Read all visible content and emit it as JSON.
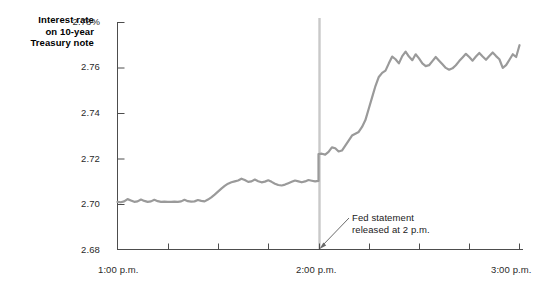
{
  "chart_data": {
    "type": "line",
    "title": "",
    "ylabel": "Interest rate on 10-year Treasury note",
    "xlabel": "",
    "ylim": [
      2.68,
      2.78
    ],
    "xlim": [
      "1:00 p.m.",
      "3:00 p.m."
    ],
    "grid": false,
    "legend": false,
    "y_unit": "%",
    "y_ticks": [
      "2.68",
      "2.70",
      "2.72",
      "2.74",
      "2.76",
      "2.78%"
    ],
    "y_tick_values": [
      2.68,
      2.7,
      2.72,
      2.74,
      2.76,
      2.78
    ],
    "x_ticks": [
      "1:00 p.m.",
      "2:00 p.m.",
      "3:00 p.m."
    ],
    "x_tick_values": [
      0,
      60,
      120
    ],
    "x_minor_tick_values": [
      15,
      30,
      45,
      75,
      90,
      105
    ],
    "series": [
      {
        "name": "10-year Treasury note yield",
        "color": "#9a9a9a",
        "x": [
          0,
          1,
          2,
          3,
          4,
          5,
          6,
          7,
          8,
          9,
          10,
          11,
          12,
          13,
          14,
          15,
          16,
          17,
          18,
          19,
          20,
          21,
          22,
          23,
          24,
          25,
          26,
          27,
          28,
          29,
          30,
          31,
          32,
          33,
          34,
          35,
          36,
          37,
          38,
          39,
          40,
          41,
          42,
          43,
          44,
          45,
          46,
          47,
          48,
          49,
          50,
          51,
          52,
          53,
          54,
          55,
          56,
          57,
          58,
          59,
          60,
          60,
          61,
          62,
          63,
          64,
          65,
          66,
          67,
          68,
          69,
          70,
          71,
          72,
          73,
          74,
          75,
          76,
          77,
          78,
          79,
          80,
          81,
          82,
          83,
          84,
          85,
          86,
          87,
          88,
          89,
          90,
          91,
          92,
          93,
          94,
          95,
          96,
          97,
          98,
          99,
          100,
          101,
          102,
          103,
          104,
          105,
          106,
          107,
          108,
          109,
          110,
          111,
          112,
          113,
          114,
          115,
          116,
          117,
          118,
          119,
          120
        ],
        "y": [
          2.701,
          2.7008,
          2.7012,
          2.7022,
          2.7016,
          2.701,
          2.7012,
          2.702,
          2.7014,
          2.701,
          2.7012,
          2.7019,
          2.7013,
          2.701,
          2.7011,
          2.701,
          2.701,
          2.7011,
          2.701,
          2.7012,
          2.7019,
          2.7013,
          2.7011,
          2.7012,
          2.7018,
          2.7014,
          2.7012,
          2.702,
          2.703,
          2.7042,
          2.7055,
          2.7068,
          2.708,
          2.709,
          2.7096,
          2.71,
          2.7104,
          2.7112,
          2.7106,
          2.7098,
          2.71,
          2.7108,
          2.7101,
          2.7096,
          2.7099,
          2.7105,
          2.7098,
          2.709,
          2.7084,
          2.7082,
          2.7086,
          2.7092,
          2.7098,
          2.7104,
          2.71,
          2.7096,
          2.71,
          2.7106,
          2.7103,
          2.71,
          2.7102,
          2.722,
          2.7222,
          2.7218,
          2.723,
          2.725,
          2.7246,
          2.7232,
          2.7236,
          2.7258,
          2.728,
          2.7302,
          2.731,
          2.7318,
          2.734,
          2.737,
          2.742,
          2.747,
          2.752,
          2.756,
          2.7578,
          2.7588,
          2.762,
          2.765,
          2.7638,
          2.762,
          2.7652,
          2.7672,
          2.765,
          2.7634,
          2.766,
          2.7642,
          2.762,
          2.7608,
          2.7612,
          2.763,
          2.7648,
          2.7632,
          2.7616,
          2.76,
          2.7592,
          2.7598,
          2.7612,
          2.763,
          2.7646,
          2.7662,
          2.7648,
          2.7632,
          2.765,
          2.7666,
          2.765,
          2.7636,
          2.7652,
          2.7668,
          2.7652,
          2.7638,
          2.76,
          2.7612,
          2.7636,
          2.766,
          2.7648,
          2.77
        ]
      }
    ],
    "annotations": [
      {
        "name": "fed-statement-annotation",
        "text_line_1": "Fed statement",
        "text_line_2": "released at 2 p.m.",
        "points_to": "2:00 p.m.",
        "marker": "vertical-line",
        "marker_color": "#c9c9c9"
      }
    ]
  },
  "labels": {
    "axis_title_line_1": "Interest rate",
    "axis_title_line_2": "on 10-year",
    "axis_title_line_3": "Treasury note"
  }
}
